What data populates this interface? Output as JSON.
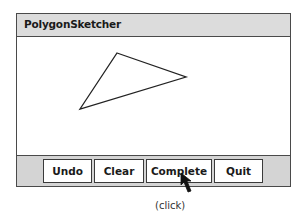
{
  "window": {
    "title": "PolygonSketcher"
  },
  "canvas": {
    "shape": "triangle",
    "vertices": [
      [
        100,
        16
      ],
      [
        169,
        40
      ],
      [
        63,
        72
      ]
    ],
    "stroke_color": "#222222"
  },
  "buttons": {
    "undo": "Undo",
    "clear": "Clear",
    "complete": "Complete",
    "quit": "Quit"
  },
  "cursor": {
    "icon": "arrow-pointer-icon",
    "target": "Complete"
  },
  "annotation": {
    "caption": "(click)"
  },
  "colors": {
    "titlebar_bg": "#dcdcdc",
    "buttonbar_bg": "#d4d4d4",
    "border": "#4a4a4a"
  }
}
